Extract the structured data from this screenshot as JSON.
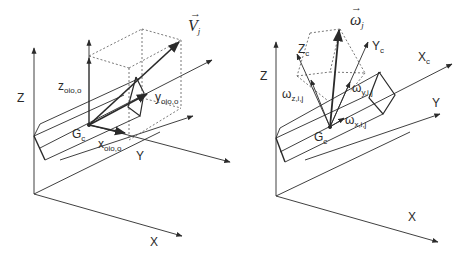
{
  "figure": {
    "left_panel": {
      "axes": {
        "x": "X",
        "y": "Y",
        "z": "Z"
      },
      "origin_label": {
        "main": "G",
        "sub": "c"
      },
      "velocity_vector": {
        "main": "V",
        "sub": "j"
      },
      "components": {
        "x": {
          "main": "x",
          "sub": "oio,o",
          "dot": "·"
        },
        "y": {
          "main": "y",
          "sub": "oio,o",
          "dot": "·"
        },
        "z": {
          "main": "z",
          "sub": "oio,o",
          "dot": "·"
        }
      }
    },
    "right_panel": {
      "axes": {
        "x": "X",
        "y": "Y",
        "z": "Z"
      },
      "body_axes": {
        "xc": {
          "main": "X",
          "sub": "c"
        },
        "yc": {
          "main": "Y",
          "sub": "c"
        },
        "zc": {
          "main": "Z",
          "sub": "c"
        }
      },
      "origin_label": {
        "main": "G",
        "sub": "c"
      },
      "angular_velocity_vector": {
        "main": "ω",
        "sub": "j"
      },
      "components": {
        "x": {
          "main": "ω",
          "sub": "x,i,j"
        },
        "y": {
          "main": "ω",
          "sub": "y,i,j"
        },
        "z": {
          "main": "ω",
          "sub": "z,i,j"
        }
      }
    },
    "colors": {
      "line": "#2a2a2a",
      "dashed": "#555555",
      "background": "#ffffff"
    }
  }
}
